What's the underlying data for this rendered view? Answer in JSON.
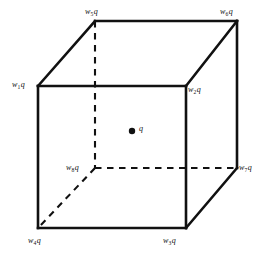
{
  "figure": {
    "line_color": "#111111",
    "background_color": "#ffffff",
    "center_point": {
      "name": "center-charge",
      "label": "q",
      "x": 132,
      "y": 131,
      "radius": 3.2
    },
    "vertices": [
      {
        "key": "w1",
        "symbol": "w",
        "subscript": "1",
        "suffix": "q",
        "x": 38,
        "y": 86,
        "label_x": 12,
        "label_y": 80,
        "position": "front-top-left"
      },
      {
        "key": "w2",
        "symbol": "w",
        "subscript": "2",
        "suffix": "q",
        "x": 186,
        "y": 86,
        "label_x": 188,
        "label_y": 85,
        "position": "front-top-right"
      },
      {
        "key": "w3",
        "symbol": "w",
        "subscript": "3",
        "suffix": "q",
        "x": 186,
        "y": 228,
        "label_x": 163,
        "label_y": 236,
        "position": "front-bottom-right"
      },
      {
        "key": "w4",
        "symbol": "w",
        "subscript": "4",
        "suffix": "q",
        "x": 38,
        "y": 228,
        "label_x": 28,
        "label_y": 236,
        "position": "front-bottom-left"
      },
      {
        "key": "w5",
        "symbol": "w",
        "subscript": "5",
        "suffix": "q",
        "x": 95,
        "y": 21,
        "label_x": 85,
        "label_y": 7,
        "position": "back-top-left"
      },
      {
        "key": "w6",
        "symbol": "w",
        "subscript": "6",
        "suffix": "q",
        "x": 237,
        "y": 21,
        "label_x": 220,
        "label_y": 7,
        "position": "back-top-right"
      },
      {
        "key": "w7",
        "symbol": "w",
        "subscript": "7",
        "suffix": "q",
        "x": 237,
        "y": 168,
        "label_x": 239,
        "label_y": 163,
        "position": "back-bottom-right"
      },
      {
        "key": "w8",
        "symbol": "w",
        "subscript": "8",
        "suffix": "q",
        "x": 95,
        "y": 168,
        "label_x": 66,
        "label_y": 163,
        "position": "back-bottom-left-hidden"
      }
    ],
    "edges": {
      "solid": [
        {
          "name": "edge-w1-w2",
          "from": "w1",
          "to": "w2"
        },
        {
          "name": "edge-w2-w3",
          "from": "w2",
          "to": "w3"
        },
        {
          "name": "edge-w3-w4",
          "from": "w3",
          "to": "w4"
        },
        {
          "name": "edge-w4-w1",
          "from": "w4",
          "to": "w1"
        },
        {
          "name": "edge-w5-w6",
          "from": "w5",
          "to": "w6"
        },
        {
          "name": "edge-w6-w7",
          "from": "w6",
          "to": "w7"
        },
        {
          "name": "edge-w7-w3",
          "from": "w7",
          "to": "w3"
        },
        {
          "name": "edge-w1-w5",
          "from": "w1",
          "to": "w5"
        },
        {
          "name": "edge-w2-w6",
          "from": "w2",
          "to": "w6"
        }
      ],
      "dashed": [
        {
          "name": "edge-w5-w8",
          "from": "w5",
          "to": "w8"
        },
        {
          "name": "edge-w8-w7",
          "from": "w8",
          "to": "w7"
        },
        {
          "name": "edge-w8-w4",
          "from": "w8",
          "to": "w4"
        }
      ]
    }
  }
}
